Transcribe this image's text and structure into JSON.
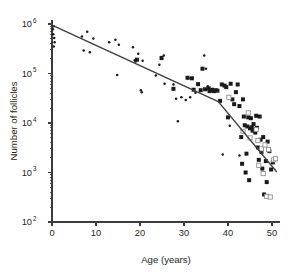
{
  "chart_data": {
    "type": "scatter",
    "title": "",
    "xlabel": "Age (years)",
    "ylabel": "Number of follicles",
    "xlim": [
      0,
      51.5
    ],
    "ylim": [
      100,
      1000000
    ],
    "yscale": "log",
    "grid": false,
    "legend": "none",
    "xticks": [
      0,
      10,
      20,
      30,
      40,
      50
    ],
    "xtick_labels": [
      "0",
      "10",
      "20",
      "30",
      "40",
      "50"
    ],
    "yticks": [
      100,
      1000,
      10000,
      100000,
      1000000
    ],
    "ytick_labels": [
      "10",
      "10",
      "10",
      "10",
      "10"
    ],
    "ytick_exponents": [
      "2",
      "3",
      "4",
      "5",
      "6"
    ],
    "series": [
      {
        "name": "small-dot-markers",
        "marker": "dot",
        "points": [
          [
            0.2,
            780000
          ],
          [
            0.3,
            620000
          ],
          [
            0.4,
            900000
          ],
          [
            0.5,
            520000
          ],
          [
            0.6,
            430000
          ],
          [
            0.4,
            350000
          ],
          [
            6.8,
            560000
          ],
          [
            7.2,
            290000
          ],
          [
            8.0,
            700000
          ],
          [
            8.6,
            270000
          ],
          [
            9.4,
            510000
          ],
          [
            13.0,
            430000
          ],
          [
            14.4,
            480000
          ],
          [
            14.8,
            93000
          ],
          [
            15.2,
            380000
          ],
          [
            18.4,
            340000
          ],
          [
            18.8,
            185000
          ],
          [
            19.0,
            175000
          ],
          [
            19.6,
            250000
          ],
          [
            20.2,
            46000
          ],
          [
            20.4,
            42000
          ],
          [
            20.6,
            180000
          ],
          [
            23.6,
            91000
          ],
          [
            24.4,
            150000
          ],
          [
            24.8,
            215000
          ],
          [
            25.4,
            230000
          ],
          [
            25.6,
            62000
          ],
          [
            27.6,
            60000
          ],
          [
            28.2,
            31000
          ],
          [
            28.6,
            10800
          ],
          [
            29.4,
            33000
          ],
          [
            30.4,
            29000
          ],
          [
            31.0,
            80000
          ],
          [
            31.4,
            33000
          ],
          [
            32.6,
            41000
          ],
          [
            34.6,
            230000
          ],
          [
            35.0,
            125000
          ],
          [
            35.4,
            55000
          ],
          [
            36.2,
            44000
          ],
          [
            38.8,
            2300
          ],
          [
            40.4,
            8800
          ],
          [
            42.6,
            2200
          ]
        ]
      },
      {
        "name": "filled-square-markers",
        "marker": "filled-square",
        "points": [
          [
            19.3,
            190000
          ],
          [
            24.9,
            205000
          ],
          [
            27.6,
            49000
          ],
          [
            30.8,
            82000
          ],
          [
            31.8,
            80000
          ],
          [
            32.2,
            47000
          ],
          [
            33.2,
            61000
          ],
          [
            33.8,
            46000
          ],
          [
            34.2,
            125000
          ],
          [
            34.8,
            48000
          ],
          [
            35.6,
            50000
          ],
          [
            35.8,
            44000
          ],
          [
            36.4,
            47000
          ],
          [
            36.8,
            44000
          ],
          [
            37.2,
            46000
          ],
          [
            37.6,
            45000
          ],
          [
            38.2,
            28000
          ],
          [
            38.6,
            60000
          ],
          [
            39.2,
            57000
          ],
          [
            39.6,
            53000
          ],
          [
            40.0,
            13000
          ],
          [
            40.6,
            62000
          ],
          [
            41.0,
            30000
          ],
          [
            41.4,
            24000
          ],
          [
            41.8,
            42000
          ],
          [
            42.2,
            60000
          ],
          [
            42.6,
            22000
          ],
          [
            43.0,
            5200
          ],
          [
            43.2,
            1500
          ],
          [
            43.4,
            30000
          ],
          [
            43.6,
            13500
          ],
          [
            43.8,
            9000
          ],
          [
            44.0,
            1000
          ],
          [
            44.2,
            2400
          ],
          [
            44.4,
            8500
          ],
          [
            44.6,
            13000
          ],
          [
            44.8,
            700
          ],
          [
            45.0,
            7800
          ],
          [
            45.2,
            12500
          ],
          [
            45.4,
            8200
          ],
          [
            45.6,
            7000
          ],
          [
            45.8,
            9500
          ],
          [
            46.0,
            7600
          ],
          [
            46.2,
            6400
          ],
          [
            46.4,
            14000
          ],
          [
            46.6,
            8000
          ],
          [
            46.8,
            3200
          ],
          [
            47.0,
            1800
          ],
          [
            47.2,
            13500
          ],
          [
            47.4,
            4600
          ],
          [
            47.6,
            2600
          ],
          [
            47.8,
            1200
          ],
          [
            48.0,
            5200
          ],
          [
            48.2,
            360
          ],
          [
            48.6,
            1700
          ],
          [
            48.8,
            640
          ],
          [
            49.0,
            4200
          ],
          [
            49.4,
            2700
          ],
          [
            49.8,
            1150
          ],
          [
            50.2,
            1600
          ]
        ]
      },
      {
        "name": "open-square-markers",
        "marker": "open-square",
        "points": [
          [
            40.2,
            33000
          ],
          [
            43.4,
            6800
          ],
          [
            44.6,
            16000
          ],
          [
            45.0,
            5000
          ],
          [
            46.4,
            7400
          ],
          [
            46.8,
            4400
          ],
          [
            47.0,
            1400
          ],
          [
            47.6,
            3000
          ],
          [
            48.0,
            950
          ],
          [
            48.4,
            3600
          ],
          [
            48.8,
            330
          ],
          [
            49.2,
            2900
          ],
          [
            49.6,
            320
          ],
          [
            50.4,
            1800
          ],
          [
            50.8,
            1900
          ]
        ]
      }
    ],
    "annotations": [
      {
        "name": "piecewise-regression-line",
        "type": "line",
        "breakpoint_age": 37.8,
        "breakpoint_value": 27000,
        "points": [
          [
            0.0,
            950000
          ],
          [
            37.8,
            27000
          ],
          [
            51.0,
            1050
          ]
        ]
      }
    ]
  }
}
